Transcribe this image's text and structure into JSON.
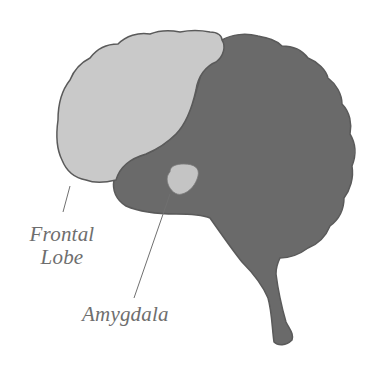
{
  "diagram": {
    "labels": {
      "frontal_lobe_line1": "Frontal",
      "frontal_lobe_line2": "Lobe",
      "amygdala": "Amygdala"
    },
    "colors": {
      "frontal_lobe_fill": "#c9c9c9",
      "brain_fill": "#6a6a6a",
      "amygdala_fill": "#c4c4c4",
      "outline": "#5a5a5a",
      "leader_line": "#707070",
      "label_text": "#6e6e6e"
    }
  }
}
